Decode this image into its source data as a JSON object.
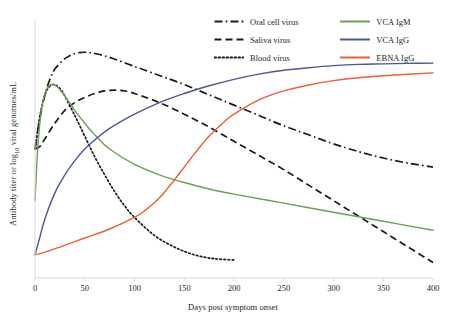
{
  "chart_data": {
    "type": "line",
    "title": "",
    "xlabel": "Days post symptom onset",
    "ylabel_prefix": "Antibody titer or log",
    "ylabel_subscript": "10",
    "ylabel_suffix": " viral genomes/mL",
    "xlim": [
      0,
      400
    ],
    "ylim": [
      0,
      100
    ],
    "xticks": [
      0,
      50,
      100,
      150,
      200,
      250,
      300,
      350,
      400
    ],
    "xtick_labels": [
      "0",
      "50",
      "100",
      "150",
      "200",
      "250",
      "300",
      "350",
      "400"
    ],
    "yticks": [],
    "ytick_labels": [],
    "grid": false,
    "legend_position": "top-right",
    "series": [
      {
        "name": "Oral cell virus",
        "style": "dash-dot",
        "color": "#1a1a1a",
        "x": [
          0,
          5,
          10,
          15,
          20,
          30,
          40,
          50,
          60,
          75,
          100,
          125,
          150,
          175,
          200,
          225,
          250,
          275,
          300,
          325,
          350,
          375,
          400
        ],
        "y": [
          50,
          62,
          71,
          77,
          81,
          85,
          87,
          87.5,
          87,
          85.5,
          82,
          78.5,
          75,
          71,
          67,
          63,
          59,
          55.5,
          52,
          49,
          46.5,
          44.5,
          43
        ]
      },
      {
        "name": "Saliva virus",
        "style": "dashed",
        "color": "#1a1a1a",
        "x": [
          0,
          5,
          10,
          20,
          30,
          40,
          50,
          60,
          70,
          80,
          90,
          100,
          125,
          150,
          175,
          200,
          225,
          250,
          275,
          300,
          325,
          350,
          375,
          400
        ],
        "y": [
          50,
          51,
          54,
          60,
          65,
          68,
          70,
          71.5,
          72.5,
          72.8,
          72.5,
          71.5,
          68,
          63.5,
          58.5,
          53,
          47.5,
          42,
          36,
          30,
          24,
          18,
          12,
          6
        ]
      },
      {
        "name": "Blood virus",
        "style": "dotted",
        "color": "#1a1a1a",
        "x": [
          0,
          3,
          6,
          10,
          14,
          18,
          22,
          26,
          30,
          40,
          50,
          60,
          70,
          80,
          90,
          100,
          120,
          140,
          160,
          180,
          200
        ],
        "y": [
          50,
          58,
          65,
          71,
          74,
          75,
          74.5,
          73,
          70.5,
          63,
          55,
          47,
          40,
          33.5,
          28,
          23.5,
          16.5,
          12,
          9,
          7.5,
          7
        ]
      },
      {
        "name": "VCA IgM",
        "style": "solid",
        "color": "#6d9e5a",
        "x": [
          0,
          3,
          6,
          9,
          12,
          15,
          18,
          22,
          26,
          30,
          40,
          50,
          60,
          75,
          100,
          125,
          150,
          175,
          200,
          250,
          300,
          350,
          400
        ],
        "y": [
          30,
          52,
          64,
          70,
          73.5,
          74.8,
          75,
          74.2,
          72.5,
          70.5,
          65,
          60,
          55.5,
          50,
          44,
          40,
          37,
          34.5,
          32.5,
          29,
          25.5,
          22,
          18.5
        ]
      },
      {
        "name": "VCA IgG",
        "style": "solid",
        "color": "#4a5894",
        "x": [
          0,
          5,
          10,
          20,
          30,
          40,
          50,
          60,
          75,
          100,
          125,
          150,
          175,
          200,
          225,
          250,
          275,
          300,
          325,
          350,
          375,
          400
        ],
        "y": [
          9,
          16,
          23,
          33,
          40,
          45.5,
          50,
          53.5,
          58,
          63.5,
          68,
          71.5,
          74.5,
          77,
          79,
          80.5,
          81.5,
          82.3,
          82.8,
          83,
          83.2,
          83.3
        ]
      },
      {
        "name": "EBNA IgG",
        "style": "solid",
        "color": "#e8603c",
        "x": [
          0,
          10,
          25,
          50,
          75,
          100,
          110,
          125,
          140,
          150,
          160,
          175,
          190,
          200,
          225,
          250,
          275,
          300,
          325,
          350,
          375,
          400
        ],
        "y": [
          9,
          10,
          12,
          15.5,
          19,
          23.5,
          26,
          31,
          38,
          43,
          48,
          55,
          60.5,
          63.5,
          69,
          72.5,
          74.8,
          76.5,
          77.6,
          78.4,
          79,
          79.5
        ]
      }
    ],
    "legend_entries": [
      {
        "label": "Oral cell virus",
        "style": "dash-dot",
        "color": "#1a1a1a"
      },
      {
        "label": "VCA IgM",
        "style": "solid",
        "color": "#6d9e5a"
      },
      {
        "label": "Saliva virus",
        "style": "dashed",
        "color": "#1a1a1a"
      },
      {
        "label": "VCA IgG",
        "style": "solid",
        "color": "#4a5894"
      },
      {
        "label": "Blood virus",
        "style": "dotted",
        "color": "#1a1a1a"
      },
      {
        "label": "EBNA IgG",
        "style": "solid",
        "color": "#e8603c"
      }
    ]
  }
}
